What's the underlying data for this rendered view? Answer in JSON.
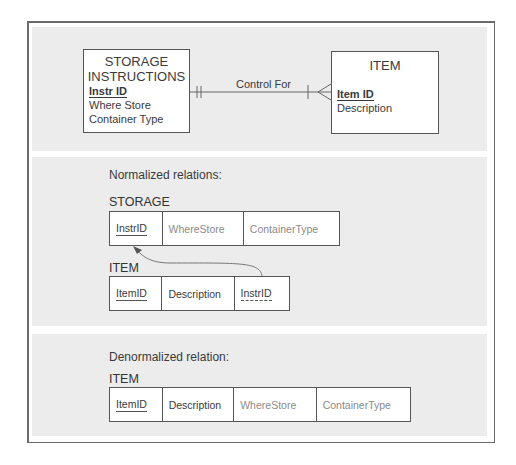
{
  "er_diagram": {
    "entity_left": {
      "title_line1": "STORAGE",
      "title_line2": "INSTRUCTIONS",
      "attributes": [
        {
          "name": "Instr ID",
          "primary_key": true
        },
        {
          "name": "Where Store",
          "primary_key": false
        },
        {
          "name": "Container Type",
          "primary_key": false
        }
      ]
    },
    "relationship": {
      "label": "Control For",
      "left_cardinality": "mandatory-one",
      "right_cardinality": "one-or-many"
    },
    "entity_right": {
      "title": "ITEM",
      "attributes": [
        {
          "name": "Item ID",
          "primary_key": true
        },
        {
          "name": "Description",
          "primary_key": false
        }
      ]
    }
  },
  "normalized": {
    "heading": "Normalized relations:",
    "storage_table": {
      "name": "STORAGE",
      "columns": [
        "InstrID",
        "WhereStore",
        "ContainerType"
      ]
    },
    "item_table": {
      "name": "ITEM",
      "columns": [
        "ItemID",
        "Description",
        "InstrID"
      ]
    }
  },
  "denormalized": {
    "heading": "Denormalized relation:",
    "item_table": {
      "name": "ITEM",
      "columns": [
        "ItemID",
        "Description",
        "WhereStore",
        "ContainerType"
      ]
    }
  },
  "colors": {
    "panel_bg": "#ececec",
    "line": "#555555",
    "text_dark": "#3a3a3a",
    "text_light": "#8a8a8a"
  }
}
